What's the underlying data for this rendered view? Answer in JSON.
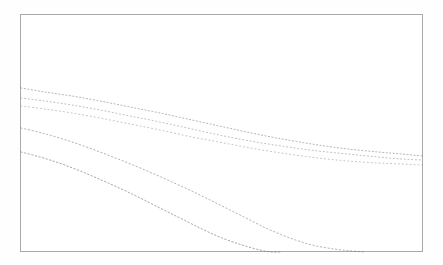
{
  "figure": {
    "name": "faded-multi-curve-decay-plot",
    "background_color": "#ffffff",
    "frame_color": "#a9a9ad",
    "curve_color": "#6e6e78",
    "caption": ""
  },
  "frame": {
    "left": 20,
    "top": 14,
    "width": 403,
    "height": 238
  },
  "chart_data": {
    "type": "line",
    "title": "",
    "subtitle": "",
    "xlabel": "",
    "ylabel": "",
    "xlim": [
      0,
      403
    ],
    "ylim": [
      0,
      238
    ],
    "grid": false,
    "legend_position": "none",
    "tick_labels_x": [],
    "tick_labels_y": [],
    "annotations": [],
    "render_style": {
      "stroke_pattern": "dotted-faint",
      "stroke_width": 0.85,
      "opacity": 0.55,
      "dash_array": "1.2 2.6"
    },
    "series": [
      {
        "name": "curve-1-upper",
        "stroke_width": 0.9,
        "opacity": 0.6,
        "dash_array": "1.1 2.4",
        "points": [
          [
            21,
            88
          ],
          [
            45,
            92
          ],
          [
            72,
            96
          ],
          [
            100,
            101
          ],
          [
            130,
            107
          ],
          [
            160,
            113
          ],
          [
            192,
            120
          ],
          [
            224,
            127
          ],
          [
            256,
            134
          ],
          [
            288,
            140
          ],
          [
            318,
            145
          ],
          [
            348,
            149
          ],
          [
            378,
            152
          ],
          [
            402,
            154
          ],
          [
            422,
            156
          ]
        ]
      },
      {
        "name": "curve-2-upper-mid",
        "stroke_width": 0.85,
        "opacity": 0.55,
        "dash_array": "1.0 2.7",
        "points": [
          [
            21,
            98
          ],
          [
            45,
            101
          ],
          [
            72,
            105
          ],
          [
            100,
            110
          ],
          [
            130,
            116
          ],
          [
            160,
            122
          ],
          [
            192,
            129
          ],
          [
            224,
            136
          ],
          [
            256,
            142
          ],
          [
            288,
            147
          ],
          [
            318,
            151
          ],
          [
            348,
            154
          ],
          [
            378,
            157
          ],
          [
            402,
            159
          ],
          [
            422,
            160
          ]
        ]
      },
      {
        "name": "curve-3-mid",
        "stroke_width": 0.85,
        "opacity": 0.5,
        "dash_array": "1.0 2.9",
        "points": [
          [
            21,
            106
          ],
          [
            45,
            109
          ],
          [
            72,
            113
          ],
          [
            100,
            118
          ],
          [
            130,
            124
          ],
          [
            160,
            130
          ],
          [
            192,
            137
          ],
          [
            224,
            143
          ],
          [
            256,
            149
          ],
          [
            288,
            154
          ],
          [
            318,
            158
          ],
          [
            348,
            161
          ],
          [
            378,
            163
          ],
          [
            402,
            164
          ],
          [
            422,
            165
          ]
        ]
      },
      {
        "name": "curve-4-steep",
        "stroke_width": 0.9,
        "opacity": 0.6,
        "dash_array": "1.3 2.5",
        "points": [
          [
            21,
            128
          ],
          [
            42,
            133
          ],
          [
            66,
            140
          ],
          [
            92,
            149
          ],
          [
            118,
            159
          ],
          [
            145,
            170
          ],
          [
            172,
            182
          ],
          [
            198,
            194
          ],
          [
            222,
            206
          ],
          [
            246,
            218
          ],
          [
            268,
            229
          ],
          [
            290,
            238
          ],
          [
            312,
            245
          ],
          [
            334,
            249
          ],
          [
            352,
            251
          ],
          [
            365,
            252
          ]
        ]
      },
      {
        "name": "curve-5-steepest",
        "stroke_width": 0.95,
        "opacity": 0.65,
        "dash_array": "1.4 2.3",
        "points": [
          [
            21,
            152
          ],
          [
            40,
            157
          ],
          [
            62,
            164
          ],
          [
            85,
            173
          ],
          [
            108,
            183
          ],
          [
            132,
            194
          ],
          [
            156,
            206
          ],
          [
            180,
            218
          ],
          [
            202,
            229
          ],
          [
            222,
            238
          ],
          [
            242,
            245
          ],
          [
            260,
            250
          ],
          [
            272,
            252
          ],
          [
            280,
            252
          ]
        ]
      }
    ]
  }
}
